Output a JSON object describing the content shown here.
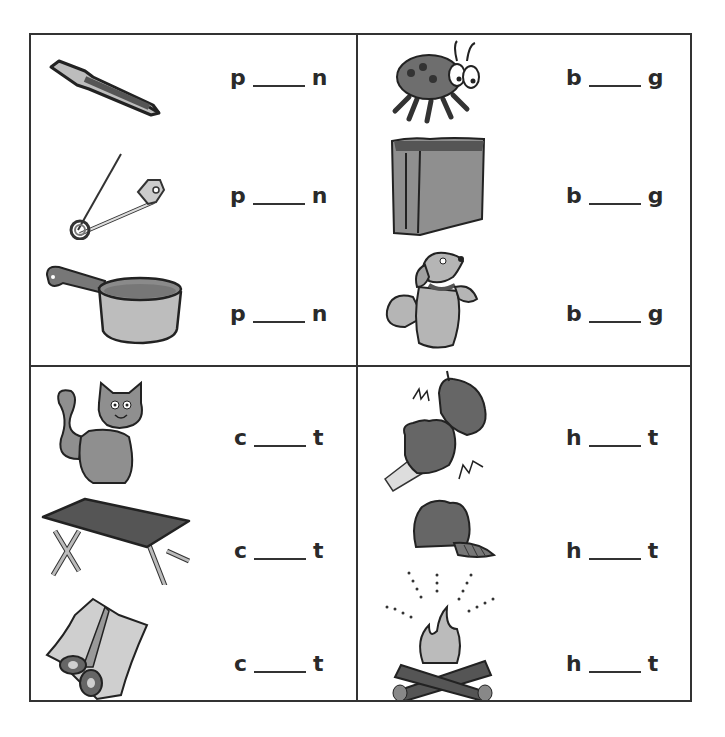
{
  "worksheet": {
    "quadrants": [
      {
        "name": "pin-pan",
        "items": [
          {
            "picture": "pen-icon",
            "first": "p",
            "last": "n"
          },
          {
            "picture": "safety-pin-icon",
            "first": "p",
            "last": "n"
          },
          {
            "picture": "pan-icon",
            "first": "p",
            "last": "n"
          }
        ]
      },
      {
        "name": "bug-bag",
        "items": [
          {
            "picture": "ladybug-icon",
            "first": "b",
            "last": "g"
          },
          {
            "picture": "paper-bag-icon",
            "first": "b",
            "last": "g"
          },
          {
            "picture": "dog-begging-icon",
            "first": "b",
            "last": "g"
          }
        ]
      },
      {
        "name": "cat-cot",
        "items": [
          {
            "picture": "cat-icon",
            "first": "c",
            "last": "t"
          },
          {
            "picture": "cot-icon",
            "first": "c",
            "last": "t"
          },
          {
            "picture": "scissors-cut-icon",
            "first": "c",
            "last": "t"
          }
        ]
      },
      {
        "name": "hit-hat",
        "items": [
          {
            "picture": "fist-hit-icon",
            "first": "h",
            "last": "t"
          },
          {
            "picture": "hat-icon",
            "first": "h",
            "last": "t"
          },
          {
            "picture": "campfire-hot-icon",
            "first": "h",
            "last": "t"
          }
        ]
      }
    ]
  },
  "colors": {
    "line": "#333333",
    "fill_dark": "#6e6e6e",
    "fill_mid": "#8f8f8f",
    "fill_light": "#bdbdbd"
  }
}
